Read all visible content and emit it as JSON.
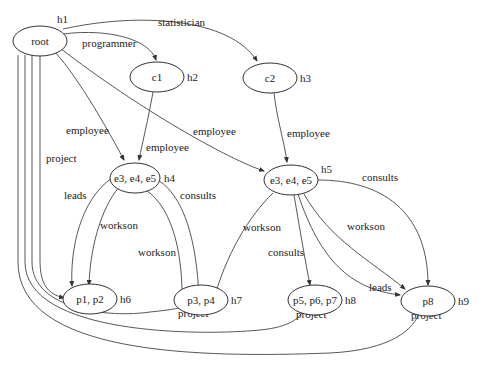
{
  "diagram": {
    "nodes": [
      {
        "id": "root",
        "label": "root",
        "tag": "h1"
      },
      {
        "id": "c1",
        "label": "c1",
        "tag": "h2"
      },
      {
        "id": "c2",
        "label": "c2",
        "tag": "h3"
      },
      {
        "id": "e_left",
        "label": "e3, e4, e5",
        "tag": "h4"
      },
      {
        "id": "e_right",
        "label": "e3, e4, e5",
        "tag": "h5"
      },
      {
        "id": "p12",
        "label": "p1, p2",
        "tag": "h6"
      },
      {
        "id": "p34",
        "label": "p3, p4",
        "tag": "h7"
      },
      {
        "id": "p567",
        "label": "p5, p6, p7",
        "tag": "h8"
      },
      {
        "id": "p8",
        "label": "p8",
        "tag": "h9"
      }
    ],
    "edges": [
      {
        "from": "root",
        "to": "c1",
        "label": "programmer"
      },
      {
        "from": "root",
        "to": "c2",
        "label": "statistician"
      },
      {
        "from": "root",
        "to": "e_left",
        "label": "employee"
      },
      {
        "from": "c1",
        "to": "e_left",
        "label": "employee"
      },
      {
        "from": "root",
        "to": "e_right",
        "label": "employee"
      },
      {
        "from": "c2",
        "to": "e_right",
        "label": "employee"
      },
      {
        "from": "e_left",
        "to": "p12",
        "label": "leads"
      },
      {
        "from": "e_left",
        "to": "p12",
        "label": "workson"
      },
      {
        "from": "e_left",
        "to": "p34",
        "label": "workson"
      },
      {
        "from": "e_left",
        "to": "p34",
        "label": "consults"
      },
      {
        "from": "e_right",
        "to": "p34",
        "label": "workson"
      },
      {
        "from": "e_right",
        "to": "p567",
        "label": "consults"
      },
      {
        "from": "e_right",
        "to": "p8",
        "label": "consults"
      },
      {
        "from": "e_right",
        "to": "p8",
        "label": "workson"
      },
      {
        "from": "e_right",
        "to": "p8",
        "label": "leads"
      },
      {
        "from": "root",
        "to": "p12",
        "label": "project"
      },
      {
        "from": "root",
        "to": "p34",
        "label": "project"
      },
      {
        "from": "root",
        "to": "p567",
        "label": "project"
      },
      {
        "from": "root",
        "to": "p8",
        "label": "project"
      }
    ]
  }
}
